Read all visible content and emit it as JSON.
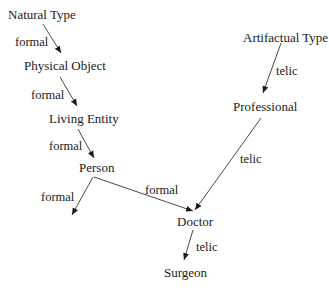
{
  "nodes": {
    "natural_type": "Natural Type",
    "physical_object": "Physical Object",
    "living_entity": "Living Entity",
    "person": "Person",
    "artifactual_type": "Artifactual Type",
    "professional": "Professional",
    "doctor": "Doctor",
    "surgeon": "Surgeon"
  },
  "edges": [
    {
      "from": "Natural Type",
      "to": "Physical Object",
      "label": "formal"
    },
    {
      "from": "Physical Object",
      "to": "Living Entity",
      "label": "formal"
    },
    {
      "from": "Living Entity",
      "to": "Person",
      "label": "formal"
    },
    {
      "from": "Person",
      "to": "(unlabeled)",
      "label": "formal"
    },
    {
      "from": "Person",
      "to": "Doctor",
      "label": "formal"
    },
    {
      "from": "Artifactual Type",
      "to": "Professional",
      "label": "telic"
    },
    {
      "from": "Professional",
      "to": "Doctor",
      "label": "telic"
    },
    {
      "from": "Doctor",
      "to": "Surgeon",
      "label": "telic"
    }
  ]
}
